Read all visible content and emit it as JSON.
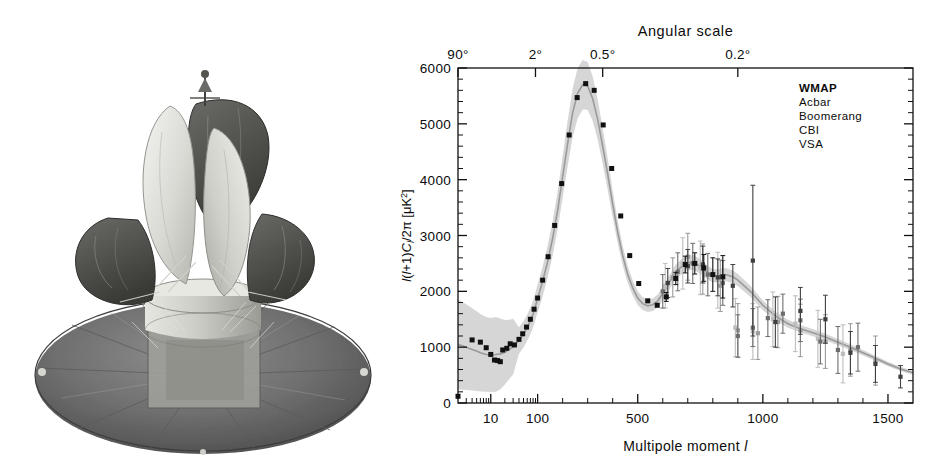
{
  "figure": {
    "panels": [
      "spacecraft-photograph",
      "cmb-power-spectrum-chart"
    ]
  },
  "photo": {
    "subject": "WMAP spacecraft",
    "description": "Grayscale photograph of the Wilkinson Microwave Anisotropy Probe spacecraft, showing back-to-back dish reflectors above a hexagonal instrument bus and a large circular solar-array / sun-shield base."
  },
  "chart_data": {
    "type": "line",
    "title": "",
    "xlabel": "Multipole moment l",
    "ylabel": "l(l+1)C_l/2π [μK²]",
    "top_axis_label": "Angular scale",
    "grid": false,
    "legend_position": "top-right",
    "xlim": [
      2,
      1600
    ],
    "ylim": [
      0,
      6000
    ],
    "y_ticks": [
      0,
      1000,
      2000,
      3000,
      4000,
      5000,
      6000
    ],
    "y_tick_labels": [
      "0",
      "1000",
      "2000",
      "3000",
      "4000",
      "5000",
      "6000"
    ],
    "x_ticks": [
      10,
      100,
      500,
      1000,
      1500
    ],
    "x_tick_labels": [
      "10",
      "100",
      "500",
      "1000",
      "1500"
    ],
    "top_ticks": [
      2,
      90,
      360,
      900
    ],
    "top_tick_labels": [
      "90°",
      "2°",
      "0.5°",
      "0.2°"
    ],
    "legend": [
      {
        "name": "WMAP",
        "color": "#111111",
        "emphasis": "bold"
      },
      {
        "name": "Acbar",
        "color": "#4a4a4a",
        "emphasis": "normal"
      },
      {
        "name": "Boomerang",
        "color": "#6d6d6d",
        "emphasis": "normal"
      },
      {
        "name": "CBI",
        "color": "#909090",
        "emphasis": "normal"
      },
      {
        "name": "VSA",
        "color": "#b4b4b4",
        "emphasis": "normal"
      }
    ],
    "model_band_color": "#cfcfcf",
    "model_curve_color": "#9a9a9a",
    "series": [
      {
        "name": "Best-fit ΛCDM model",
        "type": "line",
        "x": [
          2,
          3,
          4,
          5,
          6,
          8,
          10,
          13,
          16,
          20,
          25,
          30,
          40,
          50,
          60,
          70,
          80,
          100,
          120,
          140,
          160,
          180,
          200,
          220,
          240,
          260,
          280,
          300,
          320,
          340,
          360,
          380,
          400,
          420,
          440,
          460,
          480,
          500,
          520,
          540,
          560,
          580,
          600,
          620,
          650,
          680,
          700,
          720,
          750,
          780,
          800,
          820,
          850,
          880,
          900,
          950,
          1000,
          1050,
          1100,
          1150,
          1200,
          1250,
          1300,
          1350,
          1400,
          1450,
          1500,
          1550,
          1600
        ],
        "y": [
          1050,
          1000,
          960,
          930,
          900,
          870,
          860,
          870,
          880,
          910,
          960,
          1010,
          1120,
          1230,
          1350,
          1470,
          1590,
          1870,
          2180,
          2530,
          2950,
          3450,
          4050,
          4650,
          5200,
          5550,
          5700,
          5680,
          5450,
          5080,
          4600,
          4100,
          3560,
          3060,
          2640,
          2300,
          2060,
          1880,
          1780,
          1740,
          1760,
          1830,
          1960,
          2110,
          2340,
          2460,
          2510,
          2520,
          2450,
          2330,
          2280,
          2280,
          2300,
          2260,
          2200,
          2000,
          1750,
          1560,
          1420,
          1330,
          1260,
          1180,
          1090,
          1000,
          900,
          800,
          700,
          610,
          540
        ]
      },
      {
        "name": "WMAP",
        "type": "scatter",
        "color": "#111111",
        "x": [
          2,
          4,
          6,
          8,
          10,
          12,
          14,
          16,
          18,
          22,
          26,
          32,
          40,
          48,
          58,
          70,
          84,
          100,
          120,
          142,
          168,
          196,
          226,
          258,
          292,
          326,
          362,
          396,
          432,
          468,
          504,
          540,
          578,
          614,
          652,
          690,
          728,
          764,
          800,
          840
        ],
        "y": [
          120,
          1130,
          1090,
          990,
          870,
          770,
          760,
          740,
          950,
          980,
          1060,
          1040,
          1140,
          1240,
          1360,
          1500,
          1680,
          1880,
          2200,
          2620,
          3180,
          3930,
          4800,
          5470,
          5720,
          5600,
          4980,
          4200,
          3350,
          2640,
          2140,
          1830,
          1750,
          1900,
          2230,
          2480,
          2500,
          2420,
          2300,
          2260
        ],
        "yerr": [
          0,
          0,
          0,
          0,
          0,
          0,
          0,
          0,
          0,
          0,
          0,
          0,
          0,
          0,
          0,
          0,
          0,
          0,
          0,
          0,
          0,
          0,
          0,
          0,
          0,
          0,
          0,
          0,
          0,
          0,
          0,
          0,
          0,
          80,
          110,
          150,
          190,
          240,
          300,
          380
        ]
      },
      {
        "name": "Acbar",
        "type": "scatter-errorbar",
        "color": "#3f3f3f",
        "x": [
          620,
          700,
          760,
          820,
          880,
          960,
          1050,
          1150,
          1250,
          1350,
          1450,
          1550
        ],
        "y": [
          2150,
          2450,
          2480,
          2250,
          2100,
          2550,
          1450,
          1650,
          1500,
          900,
          700,
          470
        ],
        "yerr": [
          260,
          300,
          330,
          330,
          380,
          1350,
          450,
          420,
          430,
          380,
          330,
          200
        ]
      },
      {
        "name": "Boomerang",
        "type": "scatter-errorbar",
        "color": "#6d6d6d",
        "x": [
          600,
          660,
          720,
          780,
          840,
          900,
          960,
          1020,
          1080,
          1150,
          1230,
          1300,
          1380
        ],
        "y": [
          2000,
          2350,
          2500,
          2300,
          2150,
          1200,
          1350,
          1520,
          1600,
          1480,
          1100,
          950,
          1000
        ],
        "yerr": [
          300,
          340,
          360,
          380,
          400,
          380,
          340,
          330,
          350,
          380,
          400,
          420,
          430
        ]
      },
      {
        "name": "CBI",
        "type": "scatter-errorbar",
        "color": "#9a9a9a",
        "x": [
          640,
          700,
          760,
          830,
          900,
          980,
          1060,
          1150,
          1250,
          1350,
          1450
        ],
        "y": [
          2250,
          2620,
          2400,
          2100,
          1300,
          1250,
          1450,
          1300,
          1100,
          950,
          760
        ],
        "yerr": [
          350,
          420,
          450,
          460,
          480,
          470,
          460,
          470,
          480,
          470,
          440
        ]
      },
      {
        "name": "VSA",
        "type": "scatter-errorbar",
        "color": "#bdbdbd",
        "x": [
          610,
          680,
          750,
          820,
          890,
          960,
          1040,
          1130,
          1220,
          1320
        ],
        "y": [
          2100,
          2500,
          2420,
          2200,
          1350,
          1280,
          1500,
          1420,
          1150,
          880
        ],
        "yerr": [
          400,
          460,
          480,
          500,
          520,
          500,
          490,
          500,
          510,
          520
        ]
      }
    ]
  }
}
